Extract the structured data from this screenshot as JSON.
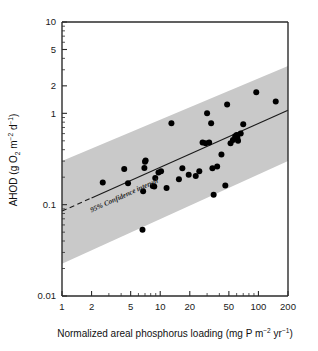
{
  "chart_data": {
    "type": "scatter",
    "title": "",
    "xlabel": "Normalized areal phosphorus loading (mg P m-2 yr-1)",
    "ylabel": "AHOD (g O2 m-2 d-1)",
    "xlabel_parts": {
      "main": "Normalized areal phosphorus loading (mg P m",
      "exp1": "−2",
      "mid": " yr",
      "exp2": "−1",
      "tail": ")"
    },
    "ylabel_parts": {
      "main": "AHOD (g O",
      "sub1": "2",
      "mid": " m",
      "exp1": "−2",
      "mid2": " d",
      "exp2": "−1",
      "tail": ")"
    },
    "xscale": "log",
    "yscale": "log",
    "xlim": [
      1,
      200
    ],
    "ylim": [
      0.01,
      10
    ],
    "grid": false,
    "legend": false,
    "xticks": [
      1,
      2,
      5,
      10,
      20,
      50,
      100,
      200
    ],
    "xticklabels": [
      "1",
      "2",
      "5",
      "10",
      "20",
      "50",
      "100",
      "200"
    ],
    "yticks": [
      0.01,
      0.1,
      1,
      2,
      5,
      10
    ],
    "yticklabels": [
      "0.01",
      "0.1",
      "1",
      "2",
      "5",
      "10"
    ],
    "annotations": [
      {
        "text": "95% Confidence interval",
        "x": 2.0,
        "y": 0.082
      }
    ],
    "series": [
      {
        "name": "Lakes",
        "marker": "filled-circle",
        "color": "#000000",
        "points": [
          [
            2.6,
            0.175
          ],
          [
            4.3,
            0.245
          ],
          [
            4.7,
            0.172
          ],
          [
            6.6,
            0.053
          ],
          [
            6.7,
            0.14
          ],
          [
            6.9,
            0.252
          ],
          [
            7.0,
            0.295
          ],
          [
            7.1,
            0.305
          ],
          [
            8.4,
            0.16
          ],
          [
            8.7,
            0.158
          ],
          [
            8.9,
            0.196
          ],
          [
            9.6,
            0.225
          ],
          [
            10.2,
            0.232
          ],
          [
            11.6,
            0.152
          ],
          [
            13.0,
            0.78
          ],
          [
            15.5,
            0.19
          ],
          [
            16.8,
            0.25
          ],
          [
            19.5,
            0.213
          ],
          [
            23.0,
            0.206
          ],
          [
            25.0,
            0.232
          ],
          [
            27.0,
            0.48
          ],
          [
            29.0,
            0.47
          ],
          [
            30.0,
            1.0
          ],
          [
            31.5,
            0.48
          ],
          [
            33.0,
            0.78
          ],
          [
            34.0,
            0.25
          ],
          [
            35.0,
            0.128
          ],
          [
            38.0,
            0.262
          ],
          [
            42.0,
            0.355
          ],
          [
            46.0,
            0.162
          ],
          [
            48.0,
            1.25
          ],
          [
            52.0,
            0.47
          ],
          [
            55.0,
            0.51
          ],
          [
            58.0,
            0.56
          ],
          [
            60.0,
            0.58
          ],
          [
            61.0,
            0.54
          ],
          [
            62.0,
            0.5
          ],
          [
            66.0,
            0.6
          ],
          [
            70.0,
            0.76
          ],
          [
            95.0,
            1.7
          ],
          [
            150.0,
            1.35
          ]
        ]
      }
    ],
    "fit": {
      "name": "regression line",
      "style": "solid",
      "solid_range": [
        2.0,
        200
      ],
      "dashed_range": [
        1.0,
        2.0
      ],
      "endpoints": [
        [
          1.0,
          0.085
        ],
        [
          200.0,
          1.08
        ]
      ]
    },
    "confidence_band": {
      "label": "95% Confidence interval",
      "level": 95,
      "color": "#c9c9c9",
      "upper": [
        [
          1.0,
          0.3
        ],
        [
          200.0,
          3.3
        ]
      ],
      "lower": [
        [
          1.0,
          0.0225
        ],
        [
          200.0,
          0.3
        ]
      ]
    }
  }
}
